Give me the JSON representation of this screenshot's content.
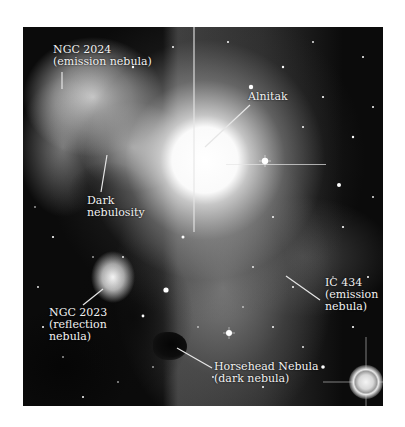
{
  "figure": {
    "background_color": "#ffffff",
    "photo_tone": "grayscale"
  },
  "labels": {
    "ngc2024": {
      "line1": "NGC 2024",
      "line2": "(emission nebula)"
    },
    "almitak": {
      "line1": "Alnitak"
    },
    "dark_nebulosity": {
      "line1": "Dark",
      "line2": "nebulosity"
    },
    "ngc2023": {
      "line1": "NGC 2023",
      "line2": "(reflection",
      "line3": "nebula)"
    },
    "ic434": {
      "line1": "IC 434",
      "line2": "(emission",
      "line3": "nebula)"
    },
    "horsehead": {
      "line1": "Horsehead Nebula",
      "line2": "(dark nebula)"
    }
  },
  "colors": {
    "label_text": "#f2f2f2",
    "leader_line": "#e6e6e6",
    "sky": "#0b0b0b"
  }
}
